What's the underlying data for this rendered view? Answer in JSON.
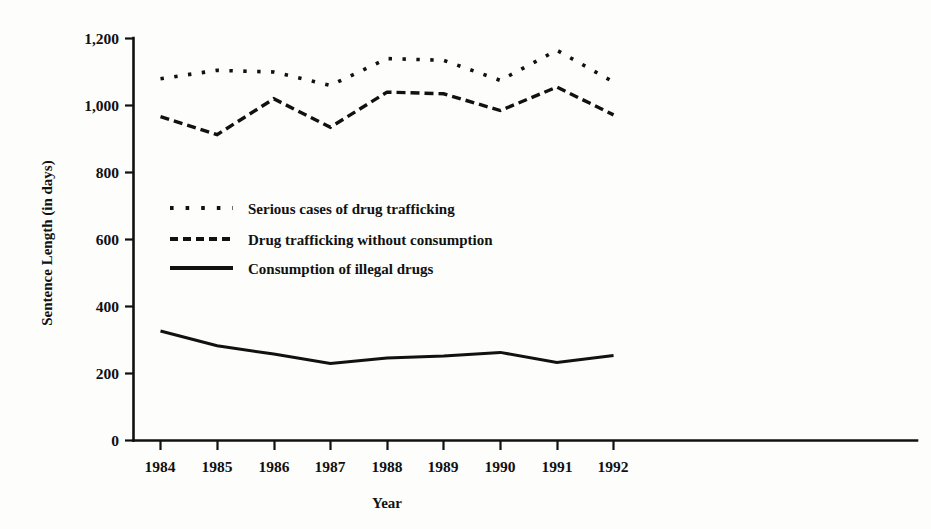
{
  "chart_data": {
    "type": "line",
    "title": "",
    "xlabel": "Year",
    "ylabel": "Sentence Length (in days)",
    "categories": [
      "1984",
      "1985",
      "1986",
      "1987",
      "1988",
      "1989",
      "1990",
      "1991",
      "1992"
    ],
    "x": [
      1984,
      1985,
      1986,
      1987,
      1988,
      1989,
      1990,
      1991,
      1992
    ],
    "xlim": [
      1984,
      1992
    ],
    "ylim": [
      0,
      1200
    ],
    "yticks": [
      "0",
      "200",
      "400",
      "600",
      "800",
      "1,000",
      "1,200"
    ],
    "ytick_values": [
      0,
      200,
      400,
      600,
      800,
      1000,
      1200
    ],
    "grid": false,
    "legend_position": "inside-upper-left",
    "series": [
      {
        "name": "Serious cases of drug trafficking",
        "style": "dotted",
        "color": "#111111",
        "values": [
          1080,
          1105,
          1100,
          1060,
          1140,
          1135,
          1075,
          1165,
          1070
        ]
      },
      {
        "name": "Drug trafficking without consumption",
        "style": "dashed",
        "color": "#111111",
        "values": [
          967,
          913,
          1020,
          935,
          1040,
          1035,
          985,
          1055,
          972
        ]
      },
      {
        "name": "Consumption of illegal drugs",
        "style": "solid",
        "color": "#111111",
        "values": [
          327,
          283,
          258,
          230,
          246,
          252,
          263,
          233,
          254
        ]
      }
    ]
  },
  "legend": {
    "items": [
      {
        "label": "Serious cases of drug trafficking",
        "style": "dotted"
      },
      {
        "label": "Drug trafficking without consumption",
        "style": "dashed"
      },
      {
        "label": "Consumption of illegal drugs",
        "style": "solid"
      }
    ]
  },
  "axes": {
    "y_title": "Sentence Length (in days)",
    "x_title": "Year",
    "y_tick_labels": [
      "1,200",
      "1,000",
      "800",
      "600",
      "400",
      "200",
      "0"
    ],
    "x_tick_labels": [
      "1984",
      "1985",
      "1986",
      "1987",
      "1988",
      "1989",
      "1990",
      "1991",
      "1992"
    ]
  },
  "colors": {
    "ink": "#111111",
    "background": "#fdfdfc"
  }
}
